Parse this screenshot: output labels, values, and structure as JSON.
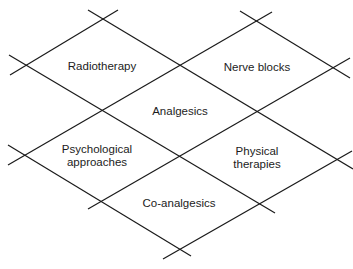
{
  "diagram": {
    "type": "lattice-of-diamonds",
    "line_color": "#1a1a1a",
    "background": "#ffffff",
    "cells": [
      {
        "id": "radiotherapy",
        "label": "Radiotherapy",
        "lines": [
          "Radiotherapy"
        ]
      },
      {
        "id": "nerve-blocks",
        "label": "Nerve blocks",
        "lines": [
          "Nerve blocks"
        ]
      },
      {
        "id": "analgesics",
        "label": "Analgesics",
        "lines": [
          "Analgesics"
        ]
      },
      {
        "id": "psychological-approaches",
        "label": "Psychological approaches",
        "lines": [
          "Psychological",
          "approaches"
        ]
      },
      {
        "id": "physical-therapies",
        "label": "Physical therapies",
        "lines": [
          "Physical",
          "therapies"
        ]
      },
      {
        "id": "co-analgesics",
        "label": "Co-analgesics",
        "lines": [
          "Co-analgesics"
        ]
      }
    ]
  }
}
